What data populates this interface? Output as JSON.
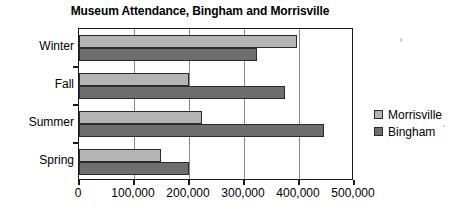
{
  "chart_data": {
    "type": "bar",
    "orientation": "horizontal",
    "title": "Museum Attendance, Bingham and Morrisville",
    "xlabel": "",
    "ylabel": "",
    "categories": [
      "Winter",
      "Fall",
      "Summer",
      "Spring"
    ],
    "series": [
      {
        "name": "Morrisville",
        "color": "#b4b4b4",
        "values": [
          397000,
          200000,
          223000,
          149000
        ]
      },
      {
        "name": "Bingham",
        "color": "#6e6e6e",
        "values": [
          323000,
          375000,
          445000,
          200000
        ]
      }
    ],
    "xlim": [
      0,
      500000
    ],
    "xticks": [
      0,
      100000,
      200000,
      300000,
      400000,
      500000
    ],
    "xtick_labels": [
      "0",
      "100,000",
      "200,000",
      "300,000",
      "400,000",
      "500,000"
    ],
    "grid": true,
    "grid_axis": "x",
    "legend": {
      "position": "right",
      "entries": [
        "Morrisville",
        "Bingham"
      ]
    }
  }
}
